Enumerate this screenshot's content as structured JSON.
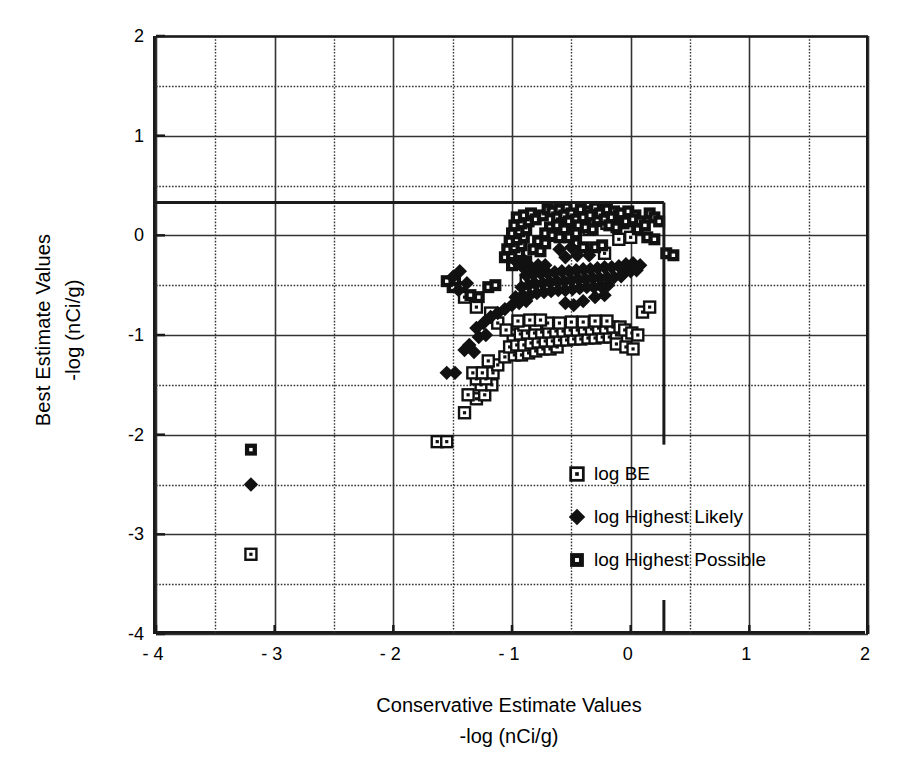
{
  "chart_data": {
    "type": "scatter",
    "title": "",
    "xlabel": "Conservative Estimate Values -log (nCi/g)",
    "xlabel_line1": "Conservative Estimate Values",
    "xlabel_line2": "-log (nCi/g)",
    "ylabel": "Best Estimate Values -log (nCi/g)",
    "ylabel_line1": "Best Estimate Values",
    "ylabel_line2": "-log (nCi/g)",
    "xlim": [
      -4,
      2
    ],
    "ylim": [
      -4,
      2
    ],
    "xticks": [
      -4,
      -3,
      -2,
      -1,
      0,
      1,
      2
    ],
    "yticks": [
      -4,
      -3,
      -2,
      -1,
      0,
      1,
      2
    ],
    "xtick_labels": [
      "- 4",
      "- 3",
      "- 2",
      "- 1",
      "0",
      "1",
      "2"
    ],
    "ytick_labels": [
      "-4",
      "-3",
      "-2",
      "-1",
      "0",
      "1",
      "2"
    ],
    "grid": true,
    "grid_minor_step": 0.5,
    "grid_style": "dotted",
    "legend_position": "inside-lower-right",
    "marker_color": "#111111",
    "axis_color": "#1a1a1a",
    "grid_color": "#333333",
    "threshold_rect": {
      "x_right": 0.28,
      "y_top": 0.33,
      "y_bottom": -2.1,
      "x_left": -4
    },
    "extra_tick_x": 0.28,
    "series": [
      {
        "name": "log BE",
        "marker": "open-square-dot",
        "points": [
          [
            -3.2,
            -3.2
          ],
          [
            -1.63,
            -2.07
          ],
          [
            -1.55,
            -2.07
          ],
          [
            -1.4,
            -1.78
          ],
          [
            -1.3,
            -1.64
          ],
          [
            -1.37,
            -1.6
          ],
          [
            -1.23,
            -1.6
          ],
          [
            -1.26,
            -1.5
          ],
          [
            -1.17,
            -1.5
          ],
          [
            -1.3,
            -1.44
          ],
          [
            -1.22,
            -1.44
          ],
          [
            -1.33,
            -1.38
          ],
          [
            -1.25,
            -1.38
          ],
          [
            -1.16,
            -1.38
          ],
          [
            -1.12,
            -1.3
          ],
          [
            -1.2,
            -1.26
          ],
          [
            -1.06,
            -1.22
          ],
          [
            -0.98,
            -1.2
          ],
          [
            -0.92,
            -1.2
          ],
          [
            -0.86,
            -1.18
          ],
          [
            -0.8,
            -1.16
          ],
          [
            -0.74,
            -1.14
          ],
          [
            -0.68,
            -1.14
          ],
          [
            -0.62,
            -1.12
          ],
          [
            -1.02,
            -1.12
          ],
          [
            -0.96,
            -1.1
          ],
          [
            -0.9,
            -1.1
          ],
          [
            -0.84,
            -1.08
          ],
          [
            -0.78,
            -1.07
          ],
          [
            -0.72,
            -1.06
          ],
          [
            -0.66,
            -1.06
          ],
          [
            -0.6,
            -1.05
          ],
          [
            -0.54,
            -1.05
          ],
          [
            -0.48,
            -1.04
          ],
          [
            -0.42,
            -1.04
          ],
          [
            -0.36,
            -1.03
          ],
          [
            -0.3,
            -1.03
          ],
          [
            -0.24,
            -1.02
          ],
          [
            -0.18,
            -1.02
          ],
          [
            -0.12,
            -1.0
          ],
          [
            -0.99,
            -1.0
          ],
          [
            -0.93,
            -0.99
          ],
          [
            -0.87,
            -0.98
          ],
          [
            -0.81,
            -0.98
          ],
          [
            -0.75,
            -0.97
          ],
          [
            -0.69,
            -0.97
          ],
          [
            -0.63,
            -0.96
          ],
          [
            -0.57,
            -0.96
          ],
          [
            -0.51,
            -0.95
          ],
          [
            -0.45,
            -0.95
          ],
          [
            -0.39,
            -0.94
          ],
          [
            -0.33,
            -0.94
          ],
          [
            -0.27,
            -0.93
          ],
          [
            -0.21,
            -0.93
          ],
          [
            -0.15,
            -0.92
          ],
          [
            -0.09,
            -0.92
          ],
          [
            -0.05,
            -0.95
          ],
          [
            0.01,
            -0.98
          ],
          [
            0.06,
            -1.0
          ],
          [
            -0.9,
            -0.9
          ],
          [
            -0.8,
            -0.89
          ],
          [
            -0.7,
            -0.88
          ],
          [
            -0.6,
            -0.88
          ],
          [
            -0.5,
            -0.87
          ],
          [
            -0.4,
            -0.87
          ],
          [
            -0.3,
            -0.86
          ],
          [
            -0.2,
            -0.86
          ],
          [
            -0.95,
            -0.86
          ],
          [
            -0.85,
            -0.85
          ],
          [
            -0.76,
            -0.85
          ],
          [
            -0.12,
            -1.09
          ],
          [
            -0.04,
            -1.12
          ],
          [
            0.02,
            -1.14
          ],
          [
            0.1,
            -0.77
          ],
          [
            0.16,
            -0.72
          ],
          [
            -0.22,
            -0.18
          ],
          [
            -0.1,
            -0.04
          ],
          [
            0.0,
            -0.02
          ],
          [
            -0.7,
            0.0
          ],
          [
            -0.55,
            0.05
          ],
          [
            -0.45,
            0.1
          ],
          [
            -0.35,
            0.06
          ],
          [
            -0.3,
            0.15
          ],
          [
            -0.2,
            0.12
          ],
          [
            -0.12,
            0.18
          ],
          [
            -0.88,
            -0.45
          ],
          [
            -0.8,
            -0.52
          ],
          [
            -1.3,
            -0.72
          ],
          [
            -1.18,
            -0.78
          ],
          [
            -1.4,
            -0.62
          ],
          [
            -1.12,
            -0.88
          ],
          [
            -1.05,
            -0.95
          ]
        ]
      },
      {
        "name": "log Highest Likely",
        "marker": "filled-diamond",
        "points": [
          [
            -3.2,
            -2.5
          ],
          [
            -1.55,
            -1.38
          ],
          [
            -1.48,
            -1.38
          ],
          [
            -1.4,
            -1.15
          ],
          [
            -1.32,
            -1.17
          ],
          [
            -1.36,
            -1.1
          ],
          [
            -1.28,
            -1.02
          ],
          [
            -1.22,
            -1.0
          ],
          [
            -1.3,
            -0.93
          ],
          [
            -1.24,
            -0.88
          ],
          [
            -1.18,
            -0.82
          ],
          [
            -1.12,
            -0.78
          ],
          [
            -1.06,
            -0.74
          ],
          [
            -1.0,
            -0.7
          ],
          [
            -0.94,
            -0.68
          ],
          [
            -0.88,
            -0.66
          ],
          [
            -0.97,
            -0.62
          ],
          [
            -0.91,
            -0.6
          ],
          [
            -0.85,
            -0.6
          ],
          [
            -0.79,
            -0.58
          ],
          [
            -0.73,
            -0.57
          ],
          [
            -0.67,
            -0.56
          ],
          [
            -0.61,
            -0.55
          ],
          [
            -0.55,
            -0.55
          ],
          [
            -0.49,
            -0.54
          ],
          [
            -0.43,
            -0.53
          ],
          [
            -0.37,
            -0.52
          ],
          [
            -0.31,
            -0.52
          ],
          [
            -0.25,
            -0.51
          ],
          [
            -0.19,
            -0.5
          ],
          [
            -0.92,
            -0.52
          ],
          [
            -0.86,
            -0.5
          ],
          [
            -0.8,
            -0.49
          ],
          [
            -0.74,
            -0.48
          ],
          [
            -0.68,
            -0.47
          ],
          [
            -0.62,
            -0.46
          ],
          [
            -0.56,
            -0.46
          ],
          [
            -0.5,
            -0.45
          ],
          [
            -0.44,
            -0.44
          ],
          [
            -0.38,
            -0.44
          ],
          [
            -0.32,
            -0.43
          ],
          [
            -0.26,
            -0.43
          ],
          [
            -0.2,
            -0.42
          ],
          [
            -0.14,
            -0.42
          ],
          [
            -0.08,
            -0.41
          ],
          [
            -0.88,
            -0.4
          ],
          [
            -0.82,
            -0.39
          ],
          [
            -0.76,
            -0.38
          ],
          [
            -0.7,
            -0.38
          ],
          [
            -0.64,
            -0.37
          ],
          [
            -0.58,
            -0.36
          ],
          [
            -0.52,
            -0.36
          ],
          [
            -0.46,
            -0.35
          ],
          [
            -0.4,
            -0.34
          ],
          [
            -0.34,
            -0.34
          ],
          [
            -0.28,
            -0.33
          ],
          [
            -0.22,
            -0.32
          ],
          [
            -0.16,
            -0.32
          ],
          [
            -0.1,
            -0.31
          ],
          [
            -0.9,
            -0.33
          ],
          [
            -0.84,
            -0.32
          ],
          [
            -0.78,
            -0.3
          ],
          [
            -0.72,
            -0.3
          ],
          [
            -0.95,
            -0.28
          ],
          [
            -0.89,
            -0.26
          ],
          [
            -0.55,
            -0.68
          ],
          [
            -0.48,
            -0.7
          ],
          [
            -0.4,
            -0.66
          ],
          [
            -0.3,
            -0.62
          ],
          [
            -0.22,
            -0.6
          ],
          [
            -0.06,
            -0.38
          ],
          [
            0.0,
            -0.36
          ],
          [
            0.05,
            -0.35
          ],
          [
            -0.04,
            -0.29
          ],
          [
            0.02,
            -0.28
          ],
          [
            0.08,
            -0.3
          ],
          [
            -0.55,
            -0.22
          ],
          [
            -0.45,
            -0.2
          ],
          [
            -0.35,
            -0.2
          ],
          [
            -0.6,
            -0.14
          ],
          [
            -0.5,
            -0.12
          ],
          [
            -1.45,
            -0.55
          ],
          [
            -1.38,
            -0.48
          ],
          [
            -1.5,
            -0.42
          ],
          [
            -1.44,
            -0.36
          ]
        ]
      },
      {
        "name": "log Highest Possible",
        "marker": "filled-square-dot",
        "points": [
          [
            -3.2,
            -2.15
          ],
          [
            -1.5,
            -0.52
          ],
          [
            -1.43,
            -0.52
          ],
          [
            -1.55,
            -0.46
          ],
          [
            -1.48,
            -0.45
          ],
          [
            -1.35,
            -0.6
          ],
          [
            -1.28,
            -0.62
          ],
          [
            -1.0,
            -0.3
          ],
          [
            -0.94,
            -0.28
          ],
          [
            -0.88,
            -0.26
          ],
          [
            -1.06,
            -0.22
          ],
          [
            -1.0,
            -0.2
          ],
          [
            -0.94,
            -0.18
          ],
          [
            -1.04,
            -0.14
          ],
          [
            -0.98,
            -0.12
          ],
          [
            -0.92,
            -0.1
          ],
          [
            -1.02,
            -0.06
          ],
          [
            -0.96,
            -0.04
          ],
          [
            -0.9,
            -0.02
          ],
          [
            -1.0,
            0.02
          ],
          [
            -0.94,
            0.04
          ],
          [
            -0.88,
            0.06
          ],
          [
            -0.98,
            0.1
          ],
          [
            -0.92,
            0.12
          ],
          [
            -0.86,
            0.14
          ],
          [
            -0.96,
            0.18
          ],
          [
            -0.9,
            0.2
          ],
          [
            -0.84,
            0.22
          ],
          [
            -0.8,
            0.16
          ],
          [
            -0.74,
            0.2
          ],
          [
            -0.7,
            0.26
          ],
          [
            -0.66,
            0.24
          ],
          [
            -0.6,
            0.26
          ],
          [
            -0.54,
            0.28
          ],
          [
            -0.62,
            0.18
          ],
          [
            -0.56,
            0.2
          ],
          [
            -0.5,
            0.22
          ],
          [
            -0.58,
            0.12
          ],
          [
            -0.52,
            0.14
          ],
          [
            -0.46,
            0.16
          ],
          [
            -0.68,
            0.08
          ],
          [
            -0.62,
            0.1
          ],
          [
            -0.56,
            0.06
          ],
          [
            -0.72,
            0.02
          ],
          [
            -0.66,
            0.0
          ],
          [
            -0.6,
            -0.02
          ],
          [
            -0.78,
            -0.06
          ],
          [
            -0.72,
            -0.08
          ],
          [
            -0.82,
            -0.14
          ],
          [
            -0.76,
            -0.16
          ],
          [
            -0.42,
            0.26
          ],
          [
            -0.36,
            0.24
          ],
          [
            -0.3,
            0.28
          ],
          [
            -0.4,
            0.18
          ],
          [
            -0.34,
            0.2
          ],
          [
            -0.28,
            0.16
          ],
          [
            -0.44,
            0.1
          ],
          [
            -0.38,
            0.08
          ],
          [
            -0.32,
            0.06
          ],
          [
            -0.26,
            0.22
          ],
          [
            -0.2,
            0.26
          ],
          [
            -0.14,
            0.24
          ],
          [
            -0.22,
            0.16
          ],
          [
            -0.16,
            0.18
          ],
          [
            -0.1,
            0.2
          ],
          [
            -0.18,
            0.1
          ],
          [
            -0.12,
            0.08
          ],
          [
            -0.06,
            0.12
          ],
          [
            -0.08,
            0.22
          ],
          [
            -0.02,
            0.24
          ],
          [
            0.04,
            0.2
          ],
          [
            -0.04,
            0.14
          ],
          [
            0.02,
            0.16
          ],
          [
            0.08,
            0.14
          ],
          [
            0.06,
            0.06
          ],
          [
            0.12,
            0.1
          ],
          [
            0.16,
            0.22
          ],
          [
            0.2,
            0.18
          ],
          [
            0.24,
            0.14
          ],
          [
            -0.46,
            -0.08
          ],
          [
            -0.4,
            -0.12
          ],
          [
            -0.3,
            -0.12
          ],
          [
            -0.24,
            -0.1
          ],
          [
            0.14,
            -0.02
          ],
          [
            0.2,
            -0.04
          ],
          [
            0.3,
            -0.18
          ],
          [
            0.36,
            -0.2
          ],
          [
            -1.2,
            -0.52
          ],
          [
            -1.14,
            -0.5
          ],
          [
            -0.52,
            -0.02
          ],
          [
            -0.46,
            0.02
          ]
        ]
      }
    ],
    "legend": [
      {
        "label": "log BE",
        "marker": "open-square-dot"
      },
      {
        "label": "log Highest Likely",
        "marker": "filled-diamond"
      },
      {
        "label": "log Highest Possible",
        "marker": "filled-square-dot"
      }
    ]
  }
}
